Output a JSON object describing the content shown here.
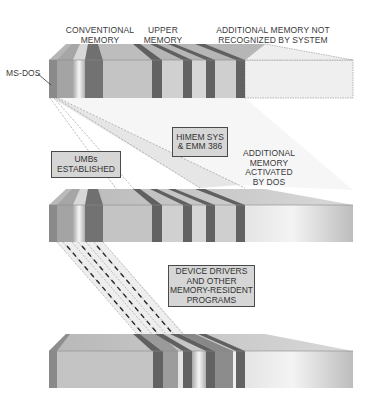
{
  "diagram": {
    "title": "",
    "colors": {
      "dark_band": "#6b6b6b",
      "mid_band": "#9a9a9a",
      "light_face": "#c8c8c8",
      "top_face": "#b4b4b4",
      "unrecognized_fill": "#ededed",
      "label_box_fill": "#d6d6d6",
      "text": "#3a3a3a"
    },
    "top_labels": {
      "conventional": [
        "CONVENTIONAL",
        "MEMORY"
      ],
      "upper": [
        "UPPER",
        "MEMORY"
      ],
      "additional": [
        "ADDITIONAL MEMORY NOT",
        "RECOGNIZED BY SYSTEM"
      ]
    },
    "msdos_label": "MS-DOS",
    "boxes": {
      "himem": [
        "HIMEM SYS",
        "& EMM 386"
      ],
      "umbs": [
        "UMBs",
        "ESTABLISHED"
      ],
      "drivers": [
        "DEVICE DRIVERS",
        "AND OTHER",
        "MEMORY-RESIDENT",
        "PROGRAMS"
      ]
    },
    "activated_label": [
      "ADDITIONAL",
      "MEMORY",
      "ACTIVATED",
      "BY DOS"
    ],
    "stages": [
      {
        "name": "memory-before-config",
        "state": "additional memory not recognized"
      },
      {
        "name": "memory-after-himem-emm386",
        "state": "additional memory activated, UMBs established"
      },
      {
        "name": "memory-after-drivers-loaded",
        "state": "device drivers and TSRs loaded into upper memory"
      }
    ]
  }
}
